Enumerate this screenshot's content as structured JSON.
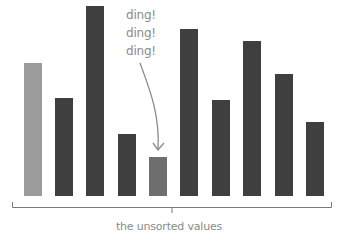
{
  "chart_data": {
    "type": "bar",
    "title": "",
    "xlabel": "the unsorted values",
    "ylabel": "",
    "categories": [
      "1",
      "2",
      "3",
      "4",
      "5",
      "6",
      "7",
      "8",
      "9",
      "10"
    ],
    "values": [
      133,
      98,
      190,
      62,
      39,
      167,
      96,
      155,
      122,
      74
    ],
    "ylim": [
      0,
      196
    ],
    "grid": false,
    "legend": null,
    "bar_colors": [
      "#9b9b9b",
      "#3f3f3f",
      "#3f3f3f",
      "#3f3f3f",
      "#6e6e6e",
      "#3f3f3f",
      "#3f3f3f",
      "#3f3f3f",
      "#3f3f3f",
      "#3f3f3f"
    ],
    "highlighted_index": 4,
    "annotations": [
      {
        "text": [
          "ding!",
          "ding!",
          "ding!"
        ],
        "points_to_index": 4
      }
    ]
  },
  "annotation": {
    "lines": [
      "ding!",
      "ding!",
      "ding!"
    ]
  },
  "bracket_label": "the unsorted values",
  "colors": {
    "bar_default": "#3f3f3f",
    "bar_first": "#9b9b9b",
    "bar_highlight": "#6e6e6e",
    "annotation_text": "#8a8a8a",
    "arrow": "#8a8a8a",
    "bracket": "#7a7a7a"
  }
}
